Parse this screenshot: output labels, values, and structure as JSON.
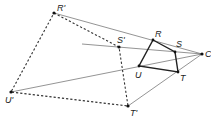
{
  "diagram": {
    "type": "dilation",
    "center": {
      "label": "C",
      "x": 202,
      "y": 54
    },
    "original": [
      {
        "label": "R",
        "x": 153,
        "y": 40,
        "lx": 155,
        "ly": 37
      },
      {
        "label": "S",
        "x": 175,
        "y": 52,
        "lx": 171,
        "ly": 48
      },
      {
        "label": "T",
        "x": 178,
        "y": 72,
        "lx": 180,
        "ly": 81
      },
      {
        "label": "U",
        "x": 139,
        "y": 66,
        "lx": 135,
        "ly": 77
      }
    ],
    "image": [
      {
        "label": "R'",
        "x": 54,
        "y": 13,
        "lx": 57,
        "ly": 11
      },
      {
        "label": "S'",
        "x": 119,
        "y": 47,
        "lx": 117,
        "ly": 43
      },
      {
        "label": "T'",
        "x": 128,
        "y": 106,
        "lx": 130,
        "ly": 116
      },
      {
        "label": "U'",
        "x": 11,
        "y": 92,
        "lx": 5,
        "ly": 102
      }
    ],
    "center_label": {
      "text": "C",
      "x": 206,
      "y": 57
    },
    "colors": {
      "line": "#555555",
      "bold": "#222222",
      "point": "#111111"
    }
  }
}
